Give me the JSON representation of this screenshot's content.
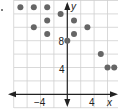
{
  "chart_data": {
    "type": "scatter",
    "title": "",
    "xlabel": "x",
    "ylabel": "y",
    "xlim": [
      -8,
      8
    ],
    "ylim": [
      -2,
      14
    ],
    "grid": true,
    "grid_step": 2,
    "x_tick_labels": [
      "-4",
      "4"
    ],
    "y_tick_labels": [
      "8",
      "4"
    ],
    "x_tick_values": [
      -4,
      4
    ],
    "y_tick_values": [
      8,
      4
    ],
    "points": [
      {
        "x": -7,
        "y": 13
      },
      {
        "x": -5,
        "y": 13
      },
      {
        "x": -3,
        "y": 13
      },
      {
        "x": -1,
        "y": 12
      },
      {
        "x": 1,
        "y": 11
      },
      {
        "x": -3,
        "y": 11
      },
      {
        "x": -5,
        "y": 10
      },
      {
        "x": 3,
        "y": 10
      },
      {
        "x": -3,
        "y": 9
      },
      {
        "x": 1,
        "y": 9
      },
      {
        "x": 0,
        "y": 8
      },
      {
        "x": 5,
        "y": 6
      },
      {
        "x": 6,
        "y": 4
      },
      {
        "x": 7,
        "y": 4
      }
    ],
    "point_color": "#666666",
    "grid_color": "#cfcfcf",
    "axis_color": "#222222"
  },
  "labels": {
    "x_axis": "x",
    "y_axis": "y",
    "x_neg4": "−4",
    "x_pos4": "4",
    "y_8": "8",
    "y_4": "4"
  }
}
